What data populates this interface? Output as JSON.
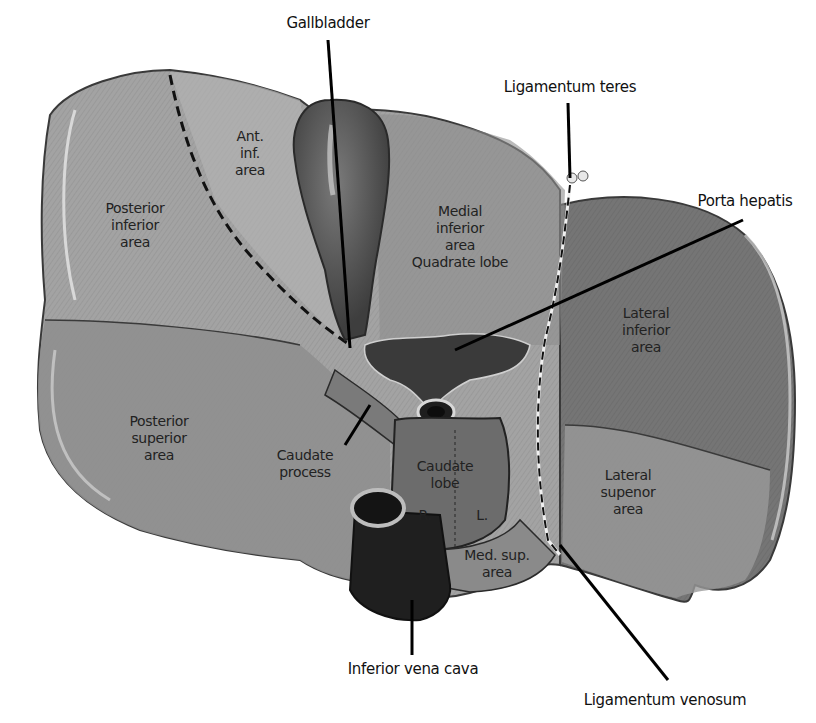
{
  "figure": {
    "type": "anatomical-diagram"
  },
  "colors": {
    "background": "#ffffff",
    "liver_light": "#a9a9a9",
    "liver_mid": "#8e8e8e",
    "liver_dark": "#6e6e6e",
    "gallbladder": "#5a5a5a",
    "vessel": "#2a2a2a",
    "leader_line": "#000000"
  },
  "callouts": {
    "gallbladder": "Gallbladder",
    "ligamentum_teres": "Ligamentum teres",
    "porta_hepatis": "Porta hepatis",
    "inferior_vena_cava": "Inferior vena cava",
    "ligamentum_venosum": "Ligamentum venosum"
  },
  "regions": {
    "ant_inf_area": "Ant.\ninf.\narea",
    "posterior_inferior_area": "Posterior\ninferior\narea",
    "medial_inferior_area": "Medial\ninferior\narea\nQuadrate lobe",
    "lateral_inferior_area": "Lateral\ninferior\narea",
    "posterior_superior_area": "Posterior\nsuperior\narea",
    "caudate_process": "Caudate\nprocess",
    "caudate_lobe": "Caudate\nlobe",
    "caudate_right": "R.",
    "caudate_left": "L.",
    "med_sup_area": "Med. sup.\narea",
    "lateral_superior_area": "Lateral\nsupenor\narea"
  }
}
